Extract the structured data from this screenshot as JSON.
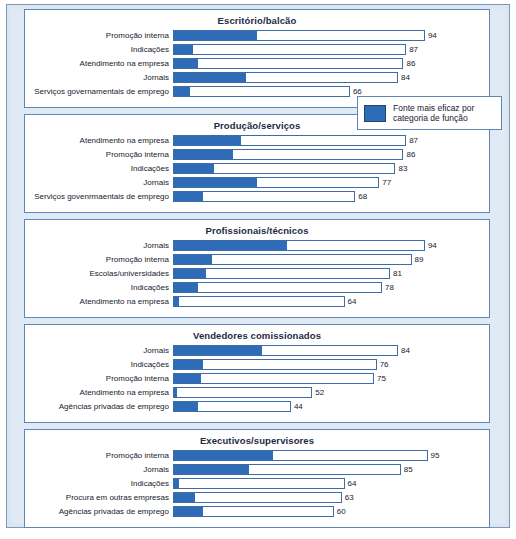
{
  "legend": {
    "label": "Fonte mais eficaz por categoria de função",
    "swatch_color": "#2f6cb7"
  },
  "style": {
    "bar_blue": "#2f6cb7",
    "bar_outline": "#3f6ca3",
    "panel_border": "#5f86b5",
    "backdrop": "#dfeaf4"
  },
  "chart_data": {
    "type": "bar",
    "title": "",
    "orientation": "horizontal",
    "xlabel": "",
    "ylabel": "",
    "xlim": [
      0,
      100
    ],
    "grid": false,
    "legend_position": "overlay-right",
    "series": [
      {
        "name": "Fonte mais eficaz por categoria de função",
        "color": "#2f6cb7"
      }
    ],
    "panels": [
      {
        "title": "Escritório/balcão",
        "categories": [
          "Promoção interna",
          "Indicações",
          "Atendimento na empresa",
          "Jornais",
          "Serviços governamentais de emprego"
        ],
        "values": [
          94,
          87,
          86,
          84,
          66
        ],
        "effective_values": [
          31,
          7,
          9,
          27,
          6
        ]
      },
      {
        "title": "Produção/serviços",
        "categories": [
          "Atendimento na empresa",
          "Promoção interna",
          "Indicações",
          "Jornais",
          "Serviços govenrmaentais de emprego"
        ],
        "values": [
          87,
          86,
          83,
          77,
          68
        ],
        "effective_values": [
          25,
          22,
          15,
          31,
          11
        ]
      },
      {
        "title": "Profissionais/técnicos",
        "categories": [
          "Jornais",
          "Promoção interna",
          "Escolas/universidades",
          "Indicações",
          "Atendimento na empresa"
        ],
        "values": [
          94,
          89,
          81,
          78,
          64
        ],
        "effective_values": [
          42,
          14,
          12,
          9,
          2
        ]
      },
      {
        "title": "Vendedores comissionados",
        "categories": [
          "Jornais",
          "Indicações",
          "Promoção interna",
          "Atendimento na empresa",
          "Agências privadas de emprego"
        ],
        "values": [
          84,
          76,
          75,
          52,
          44
        ],
        "effective_values": [
          33,
          11,
          10,
          1,
          9
        ]
      },
      {
        "title": "Executivos/supervisores",
        "categories": [
          "Promoção interna",
          "Jornais",
          "Indicações",
          "Procura em outras empresas",
          "Agências privadas de emprego"
        ],
        "values": [
          95,
          85,
          64,
          63,
          60
        ],
        "effective_values": [
          37,
          28,
          2,
          8,
          11
        ]
      }
    ]
  }
}
